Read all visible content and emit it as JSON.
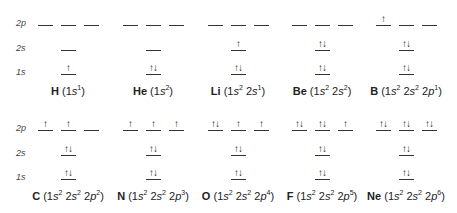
{
  "row_labels": {
    "p2": "2p",
    "s2": "2s",
    "s1": "1s"
  },
  "elements": [
    {
      "symbol": "H",
      "config": "(1s1)",
      "label_parts": [
        [
          "1",
          "s",
          "1"
        ]
      ],
      "s1": "↑",
      "s2": "",
      "p": [
        "",
        "",
        ""
      ],
      "row": 0,
      "col": 0
    },
    {
      "symbol": "He",
      "config": "(1s2)",
      "label_parts": [
        [
          "1",
          "s",
          "2"
        ]
      ],
      "s1": "↑↓",
      "s2": "",
      "p": [
        "",
        "",
        ""
      ],
      "row": 0,
      "col": 1
    },
    {
      "symbol": "Li",
      "config": "(1s2 2s1)",
      "label_parts": [
        [
          "1",
          "s",
          "2"
        ],
        [
          "2",
          "s",
          "1"
        ]
      ],
      "s1": "↑↓",
      "s2": "↑",
      "p": [
        "",
        "",
        ""
      ],
      "row": 0,
      "col": 2
    },
    {
      "symbol": "Be",
      "config": "(1s2 2s2)",
      "label_parts": [
        [
          "1",
          "s",
          "2"
        ],
        [
          "2",
          "s",
          "2"
        ]
      ],
      "s1": "↑↓",
      "s2": "↑↓",
      "p": [
        "",
        "",
        ""
      ],
      "row": 0,
      "col": 3
    },
    {
      "symbol": "B",
      "config": "(1s2 2s2 2p1)",
      "label_parts": [
        [
          "1",
          "s",
          "2"
        ],
        [
          "2",
          "s",
          "2"
        ],
        [
          "2",
          "p",
          "1"
        ]
      ],
      "s1": "↑↓",
      "s2": "↑↓",
      "p": [
        "↑",
        "",
        ""
      ],
      "row": 0,
      "col": 4
    },
    {
      "symbol": "C",
      "config": "(1s2 2s2 2p2)",
      "label_parts": [
        [
          "1",
          "s",
          "2"
        ],
        [
          "2",
          "s",
          "2"
        ],
        [
          "2",
          "p",
          "2"
        ]
      ],
      "s1": "↑↓",
      "s2": "↑↓",
      "p": [
        "↑",
        "↑",
        ""
      ],
      "row": 1,
      "col": 0
    },
    {
      "symbol": "N",
      "config": "(1s2 2s2 2p3)",
      "label_parts": [
        [
          "1",
          "s",
          "2"
        ],
        [
          "2",
          "s",
          "2"
        ],
        [
          "2",
          "p",
          "3"
        ]
      ],
      "s1": "↑↓",
      "s2": "↑↓",
      "p": [
        "↑",
        "↑",
        "↑"
      ],
      "row": 1,
      "col": 1
    },
    {
      "symbol": "O",
      "config": "(1s2 2s2 2p4)",
      "label_parts": [
        [
          "1",
          "s",
          "2"
        ],
        [
          "2",
          "s",
          "2"
        ],
        [
          "2",
          "p",
          "4"
        ]
      ],
      "s1": "↑↓",
      "s2": "↑↓",
      "p": [
        "↑↓",
        "↑",
        "↑"
      ],
      "row": 1,
      "col": 2
    },
    {
      "symbol": "F",
      "config": "(1s2 2s2 2p5)",
      "label_parts": [
        [
          "1",
          "s",
          "2"
        ],
        [
          "2",
          "s",
          "2"
        ],
        [
          "2",
          "p",
          "5"
        ]
      ],
      "s1": "↑↓",
      "s2": "↑↓",
      "p": [
        "↑↓",
        "↑↓",
        "↑"
      ],
      "row": 1,
      "col": 3
    },
    {
      "symbol": "Ne",
      "config": "(1s2 2s2 2p6)",
      "label_parts": [
        [
          "1",
          "s",
          "2"
        ],
        [
          "2",
          "s",
          "2"
        ],
        [
          "2",
          "p",
          "6"
        ]
      ],
      "s1": "↑↓",
      "s2": "↑↓",
      "p": [
        "↑↓",
        "↑↓",
        "↑↓"
      ],
      "row": 1,
      "col": 4
    }
  ]
}
